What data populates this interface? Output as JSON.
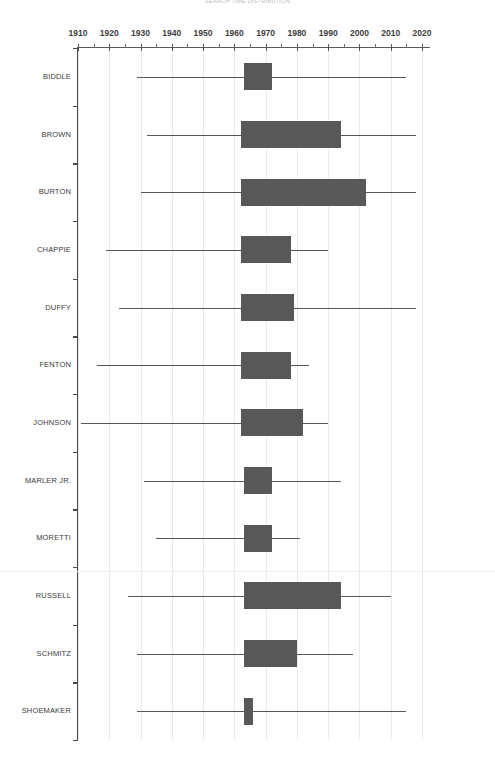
{
  "chart": {
    "title": "SEARCH TIME DISTRIBUTION",
    "xlabel": "",
    "ylabel": ""
  },
  "chart_data": {
    "type": "boxplot",
    "title": "SEARCH TIME DISTRIBUTION",
    "xlabel": "",
    "ylabel": "",
    "xlim": [
      1905,
      2025
    ],
    "grid": true,
    "legend": false,
    "orientation": "horizontal",
    "box_color": "#585858",
    "whisker_color": "#585858",
    "grid_color": "#e9e9ef",
    "xticks": [
      1910,
      1920,
      1930,
      1940,
      1950,
      1960,
      1970,
      1980,
      1990,
      2000,
      2010,
      2020
    ],
    "xtick_labels": [
      "1910",
      "1920",
      "1930",
      "1940",
      "1950",
      "1960",
      "1970",
      "1980",
      "1990",
      "2000",
      "2010",
      "2020"
    ],
    "minor_tick_interval": 5,
    "categories": [
      "BIDDLE",
      "BROWN",
      "BURTON",
      "CHAPPIE",
      "DUFFY",
      "FENTON",
      "JOHNSON",
      "MARLER JR.",
      "MORETTI",
      "RUSSELL",
      "SCHMITZ",
      "SHOEMAKER"
    ],
    "boxes": [
      {
        "label": "BIDDLE",
        "whisker_low": 1929,
        "q1": 1963,
        "q3": 1972,
        "whisker_high": 2015
      },
      {
        "label": "BROWN",
        "whisker_low": 1932,
        "q1": 1962,
        "q3": 1994,
        "whisker_high": 2018
      },
      {
        "label": "BURTON",
        "whisker_low": 1930,
        "q1": 1962,
        "q3": 2002,
        "whisker_high": 2018
      },
      {
        "label": "CHAPPIE",
        "whisker_low": 1919,
        "q1": 1962,
        "q3": 1978,
        "whisker_high": 1990
      },
      {
        "label": "DUFFY",
        "whisker_low": 1923,
        "q1": 1962,
        "q3": 1979,
        "whisker_high": 2018
      },
      {
        "label": "FENTON",
        "whisker_low": 1916,
        "q1": 1962,
        "q3": 1978,
        "whisker_high": 1984
      },
      {
        "label": "JOHNSON",
        "whisker_low": 1911,
        "q1": 1962,
        "q3": 1982,
        "whisker_high": 1990
      },
      {
        "label": "MARLER JR.",
        "whisker_low": 1931,
        "q1": 1963,
        "q3": 1972,
        "whisker_high": 1994
      },
      {
        "label": "MORETTI",
        "whisker_low": 1935,
        "q1": 1963,
        "q3": 1972,
        "whisker_high": 1981
      },
      {
        "label": "RUSSELL",
        "whisker_low": 1926,
        "q1": 1963,
        "q3": 1994,
        "whisker_high": 2010
      },
      {
        "label": "SCHMITZ",
        "whisker_low": 1929,
        "q1": 1963,
        "q3": 1980,
        "whisker_high": 1998
      },
      {
        "label": "SHOEMAKER",
        "whisker_low": 1929,
        "q1": 1963,
        "q3": 1966,
        "whisker_high": 2015
      }
    ]
  }
}
